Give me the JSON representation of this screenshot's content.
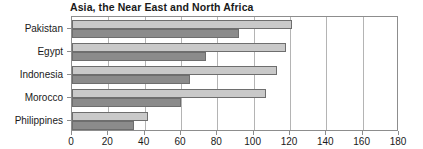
{
  "chart_data": {
    "type": "bar",
    "orientation": "horizontal",
    "title": "Asia, the Near East and North Africa",
    "xlabel": "",
    "ylabel": "",
    "categories": [
      "Pakistan",
      "Egypt",
      "Indonesia",
      "Morocco",
      "Philippines"
    ],
    "series": [
      {
        "name": "series-1",
        "color": "#c9c9c9",
        "values": [
          121,
          118,
          113,
          107,
          42
        ]
      },
      {
        "name": "series-2",
        "color": "#8b8b8b",
        "values": [
          92,
          74,
          65,
          60,
          34
        ]
      }
    ],
    "xlim": [
      0,
      180
    ],
    "xticks": [
      0,
      20,
      40,
      60,
      80,
      100,
      120,
      140,
      160,
      180
    ],
    "xtick_labels": [
      "0",
      "20",
      "40",
      "60",
      "80",
      "100",
      "120",
      "140",
      "160",
      "180"
    ],
    "gridlines": {
      "x": [
        20,
        40,
        60,
        80,
        100,
        120,
        140,
        160
      ],
      "y": []
    },
    "grid": true,
    "legend": null,
    "annotations": []
  },
  "style": {
    "bar_edge_color": "#6e6e6e",
    "axis_color": "#8d8d8d",
    "grid_color": "#b4b4b4",
    "text_color": "#1a1a1a",
    "background": "#ffffff"
  }
}
